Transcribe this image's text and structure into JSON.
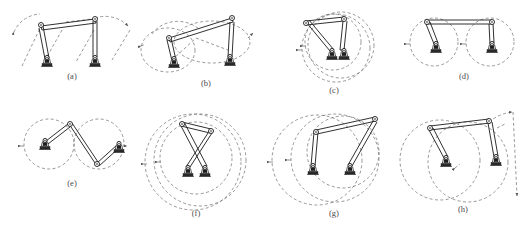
{
  "figure": {
    "kind": "technical-line-drawing",
    "background_color": "#ffffff",
    "line_color": "#1a1a1a",
    "dash_color": "#6b6b6b",
    "label_color": "#4a4a4a",
    "panel_count": 8,
    "panels": [
      {
        "id": "a",
        "label": "(a)",
        "label_x": 72,
        "label_y": 79,
        "configuration": "symmetric-peak",
        "workspace_curve": "open-arcs",
        "base_count": 2
      },
      {
        "id": "b",
        "label": "(b)",
        "label_x": 206,
        "label_y": 86,
        "configuration": "tilted-parallel",
        "workspace_curve": "overlapping-ellipses",
        "base_count": 2
      },
      {
        "id": "c",
        "label": "(c)",
        "label_x": 334,
        "label_y": 93,
        "configuration": "folded-coincident-bases",
        "workspace_curve": "concentric-circles",
        "base_count": 2
      },
      {
        "id": "d",
        "label": "(d)",
        "label_x": 464,
        "label_y": 79,
        "configuration": "horizontal-top-link",
        "workspace_curve": "tangent-circles",
        "base_count": 2
      },
      {
        "id": "e",
        "label": "(e)",
        "label_x": 72,
        "label_y": 186,
        "configuration": "zigzag",
        "workspace_curve": "tangent-circles",
        "base_count": 2
      },
      {
        "id": "f",
        "label": "(f)",
        "label_x": 196,
        "label_y": 216,
        "configuration": "crossed-arms",
        "workspace_curve": "concentric-circles",
        "base_count": 2
      },
      {
        "id": "g",
        "label": "(g)",
        "label_x": 334,
        "label_y": 216,
        "configuration": "inclined-top-link",
        "workspace_curve": "overlapping-circles",
        "base_count": 2
      },
      {
        "id": "h",
        "label": "(h)",
        "label_x": 463,
        "label_y": 212,
        "configuration": "inclined-with-arrow-arc",
        "workspace_curve": "overlapping-circles-with-arrows",
        "base_count": 2
      }
    ]
  }
}
